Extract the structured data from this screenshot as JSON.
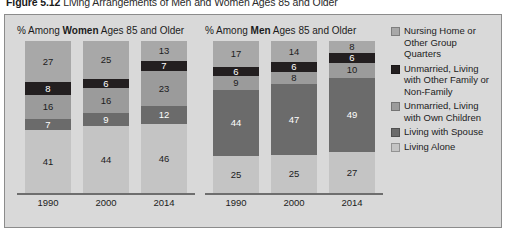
{
  "figure": {
    "number": "Figure 5.12",
    "caption": "Living Arrangements of Men and Women Ages 85 and Older"
  },
  "panels": [
    {
      "key": "women",
      "heading_prefix": "% Among ",
      "heading_bold": "Women",
      "heading_suffix": " Ages 85 and Older"
    },
    {
      "key": "men",
      "heading_prefix": "% Among ",
      "heading_bold": "Men",
      "heading_suffix": " Ages 85 and Older"
    }
  ],
  "legend": {
    "position": "right",
    "items": [
      {
        "label": "Nursing Home or Other Group Quarters",
        "color": "#a8a8a8"
      },
      {
        "label": "Unmarried, Living with Other Family or Non-Family",
        "color": "#231f20"
      },
      {
        "label": "Unmarried, Living with Own Children",
        "color": "#9b9b9b"
      },
      {
        "label": "Living with Spouse",
        "color": "#6b6b6b"
      },
      {
        "label": "Living Alone",
        "color": "#c4c4c4"
      }
    ]
  },
  "chart_data": {
    "type": "bar",
    "subtype": "stacked-100-percent",
    "title": "Living Arrangements of Men and Women Ages 85 and Older",
    "xlabel": "",
    "ylabel": "",
    "ylim": [
      0,
      100
    ],
    "grid": false,
    "categories": [
      "1990",
      "2000",
      "2014"
    ],
    "stack_order_top_to_bottom": [
      "Nursing Home or Other Group Quarters",
      "Unmarried, Living with Other Family or Non-Family",
      "Unmarried, Living with Own Children",
      "Living with Spouse",
      "Living Alone"
    ],
    "panels": [
      {
        "name": "Women Ages 85 and Older",
        "series": [
          {
            "name": "Nursing Home or Other Group Quarters",
            "color": "#a8a8a8",
            "values": [
              27,
              25,
              13
            ]
          },
          {
            "name": "Unmarried, Living with Other Family or Non-Family",
            "color": "#231f20",
            "values": [
              8,
              6,
              7
            ]
          },
          {
            "name": "Unmarried, Living with Own Children",
            "color": "#9b9b9b",
            "values": [
              16,
              16,
              23
            ]
          },
          {
            "name": "Living with Spouse",
            "color": "#6b6b6b",
            "values": [
              7,
              9,
              12
            ]
          },
          {
            "name": "Living Alone",
            "color": "#c4c4c4",
            "values": [
              41,
              44,
              46
            ]
          }
        ]
      },
      {
        "name": "Men Ages 85 and Older",
        "series": [
          {
            "name": "Nursing Home or Other Group Quarters",
            "color": "#a8a8a8",
            "values": [
              17,
              14,
              8
            ]
          },
          {
            "name": "Unmarried, Living with Other Family or Non-Family",
            "color": "#231f20",
            "values": [
              6,
              6,
              6
            ]
          },
          {
            "name": "Unmarried, Living with Own Children",
            "color": "#9b9b9b",
            "values": [
              9,
              8,
              10
            ]
          },
          {
            "name": "Living with Spouse",
            "color": "#6b6b6b",
            "values": [
              44,
              47,
              49
            ]
          },
          {
            "name": "Living Alone",
            "color": "#c4c4c4",
            "values": [
              25,
              25,
              27
            ]
          }
        ]
      }
    ]
  }
}
